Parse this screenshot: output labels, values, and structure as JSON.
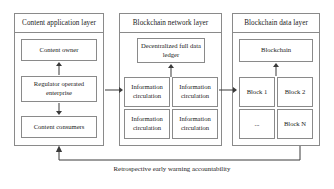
{
  "diagram": {
    "panels": [
      {
        "id": "content-application-layer",
        "header": "Content application layer",
        "nodes": [
          {
            "id": "content-owner",
            "label": "Content owner"
          },
          {
            "id": "regulator-operated-enterprise",
            "label": "Regulator operated enterprise"
          },
          {
            "id": "content-consumers",
            "label": "Content consumers"
          }
        ]
      },
      {
        "id": "blockchain-network-layer",
        "header": "Blockchain network layer",
        "nodes": [
          {
            "id": "decentralized-full-data-ledger",
            "label": "Decentralized full data ledger"
          },
          {
            "id": "information-circulation-1",
            "label": "Information circulation"
          },
          {
            "id": "information-circulation-2",
            "label": "Information circulation"
          },
          {
            "id": "information-circulation-3",
            "label": "Information circulation"
          },
          {
            "id": "information-circulation-4",
            "label": "Information circulation"
          }
        ]
      },
      {
        "id": "blockchain-data-layer",
        "header": "Blockchain data layer",
        "nodes": [
          {
            "id": "blockchain",
            "label": "Blockchain"
          },
          {
            "id": "block-1",
            "label": "Block 1"
          },
          {
            "id": "block-2",
            "label": "Block 2"
          },
          {
            "id": "block-ellipsis",
            "label": "..."
          },
          {
            "id": "block-n",
            "label": "Block N"
          }
        ]
      }
    ],
    "caption": "Retrospective early warning accountability",
    "colors": {
      "border": "#8a8a8a",
      "arrow": "#3a3a3a",
      "text": "#1a1a1a",
      "background": "#ffffff"
    }
  }
}
